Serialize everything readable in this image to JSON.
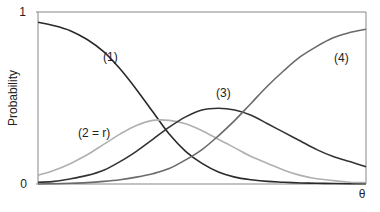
{
  "chart_data": {
    "type": "line",
    "title": "",
    "xlabel": "θ",
    "ylabel": "Probability",
    "ylim": [
      0,
      1
    ],
    "yticks": [
      "0",
      "1"
    ],
    "xticks": [],
    "grid": false,
    "legend": "none (curves labeled inline)",
    "x": [
      0,
      0.05,
      0.1,
      0.15,
      0.2,
      0.25,
      0.3,
      0.35,
      0.4,
      0.45,
      0.5,
      0.55,
      0.6,
      0.65,
      0.7,
      0.75,
      0.8,
      0.85,
      0.9,
      0.95,
      1.0
    ],
    "series": [
      {
        "name": "(1)",
        "color": "#2a2a2a",
        "values": [
          0.94,
          0.92,
          0.89,
          0.84,
          0.77,
          0.67,
          0.55,
          0.42,
          0.29,
          0.19,
          0.12,
          0.07,
          0.04,
          0.025,
          0.015,
          0.01,
          0.006,
          0.004,
          0.003,
          0.002,
          0.001
        ]
      },
      {
        "name": "(2 = r)",
        "color": "#b0b0b0",
        "values": [
          0.05,
          0.08,
          0.12,
          0.17,
          0.23,
          0.29,
          0.34,
          0.37,
          0.37,
          0.35,
          0.31,
          0.26,
          0.21,
          0.16,
          0.12,
          0.08,
          0.05,
          0.03,
          0.02,
          0.01,
          0.008
        ]
      },
      {
        "name": "(3)",
        "color": "#333333",
        "values": [
          0.01,
          0.015,
          0.03,
          0.05,
          0.08,
          0.13,
          0.19,
          0.26,
          0.33,
          0.39,
          0.43,
          0.44,
          0.43,
          0.4,
          0.35,
          0.3,
          0.25,
          0.2,
          0.16,
          0.13,
          0.1
        ]
      },
      {
        "name": "(4)",
        "color": "#6a6a6a",
        "values": [
          0.0,
          0.002,
          0.004,
          0.008,
          0.015,
          0.025,
          0.04,
          0.06,
          0.09,
          0.14,
          0.2,
          0.28,
          0.37,
          0.47,
          0.57,
          0.66,
          0.74,
          0.8,
          0.85,
          0.88,
          0.9
        ]
      }
    ],
    "annotations": [
      {
        "text": "(1)",
        "x": 0.28,
        "y": 0.74
      },
      {
        "text": "(2 = r)",
        "x": 0.2,
        "y": 0.31
      },
      {
        "text": "(3)",
        "x": 0.6,
        "y": 0.5
      },
      {
        "text": "(4)",
        "x": 0.89,
        "y": 0.73
      }
    ]
  },
  "labels": {
    "y_top": "1",
    "y_bottom": "0",
    "x_axis": "θ",
    "y_axis": "Probability",
    "curve1": "(1)",
    "curve2": "(2 = r)",
    "curve3": "(3)",
    "curve4": "(4)"
  }
}
